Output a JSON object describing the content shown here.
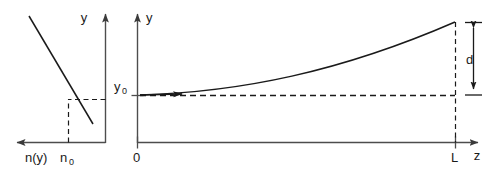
{
  "figure": {
    "kind": "ray-deflection-diagram",
    "background_color": "#ffffff",
    "stroke_color": "#1a1a1a",
    "axis_color": "#4d4d4d",
    "width": 502,
    "height": 169
  },
  "left_plot": {
    "name": "refractive-index-profile",
    "x_axis_label": "n(y)",
    "x_axis_direction": "left",
    "y_axis_label": "y",
    "y_axis_direction": "up",
    "tick_label": "n",
    "tick_label_sub": "0",
    "curve_description": "decreasing straight line n(y)"
  },
  "right_plot": {
    "name": "ray-trajectory",
    "y_axis_label": "y",
    "z_axis_label": "z",
    "origin_label": "0",
    "start_label": "y",
    "start_label_sub": "0",
    "end_tick_label": "L",
    "deflection_label": "d",
    "curve_description": "ray bending upward from y0 to y0 + d over length L"
  }
}
